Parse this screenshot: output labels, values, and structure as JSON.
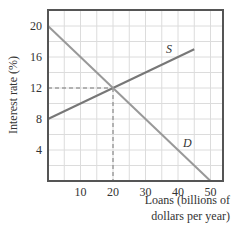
{
  "chart_data": {
    "type": "line",
    "title": "",
    "xlabel": "Loans (billions of dollars per year)",
    "xlabel_lines": [
      "Loans (billions of",
      "dollars per year)"
    ],
    "ylabel": "Interest rate (%)",
    "xlim": [
      0,
      54
    ],
    "ylim": [
      0,
      22
    ],
    "x_ticks": [
      10,
      20,
      30,
      40,
      50
    ],
    "x_tick_labels": [
      "10",
      "20",
      "30",
      "40",
      "50"
    ],
    "y_ticks": [
      4,
      8,
      12,
      16,
      20
    ],
    "y_tick_labels": [
      "4",
      "8",
      "12",
      "16",
      "20"
    ],
    "grid": true,
    "series": [
      {
        "name": "S",
        "label": "S",
        "x": [
          0,
          45
        ],
        "y": [
          8,
          17
        ],
        "color": "#777777"
      },
      {
        "name": "D",
        "label": "D",
        "x": [
          0,
          50
        ],
        "y": [
          20,
          0
        ],
        "color": "#999999"
      }
    ],
    "equilibrium": {
      "x": 20,
      "y": 12,
      "guide_lines": "dashed"
    },
    "legend": "none (inline curve labels)"
  }
}
